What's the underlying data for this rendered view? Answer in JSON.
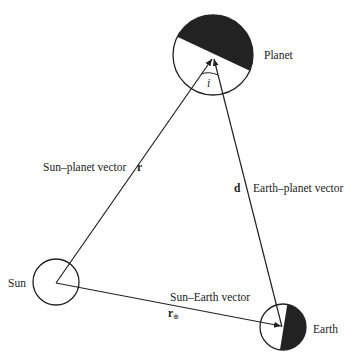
{
  "diagram": {
    "bodies": {
      "planet": {
        "label": "Planet"
      },
      "sun": {
        "label": "Sun"
      },
      "earth": {
        "label": "Earth"
      }
    },
    "vectors": {
      "sun_planet": {
        "label": "Sun–planet vector",
        "symbol": "r"
      },
      "earth_planet": {
        "label": "Earth–planet vector",
        "symbol": "d"
      },
      "sun_earth": {
        "label": "Sun–Earth vector",
        "symbol": "r",
        "subscript": "⊕"
      }
    },
    "angle": {
      "symbol": "i"
    },
    "colors": {
      "stroke": "#222222",
      "shadow": "#222222",
      "background": "#ffffff"
    }
  }
}
